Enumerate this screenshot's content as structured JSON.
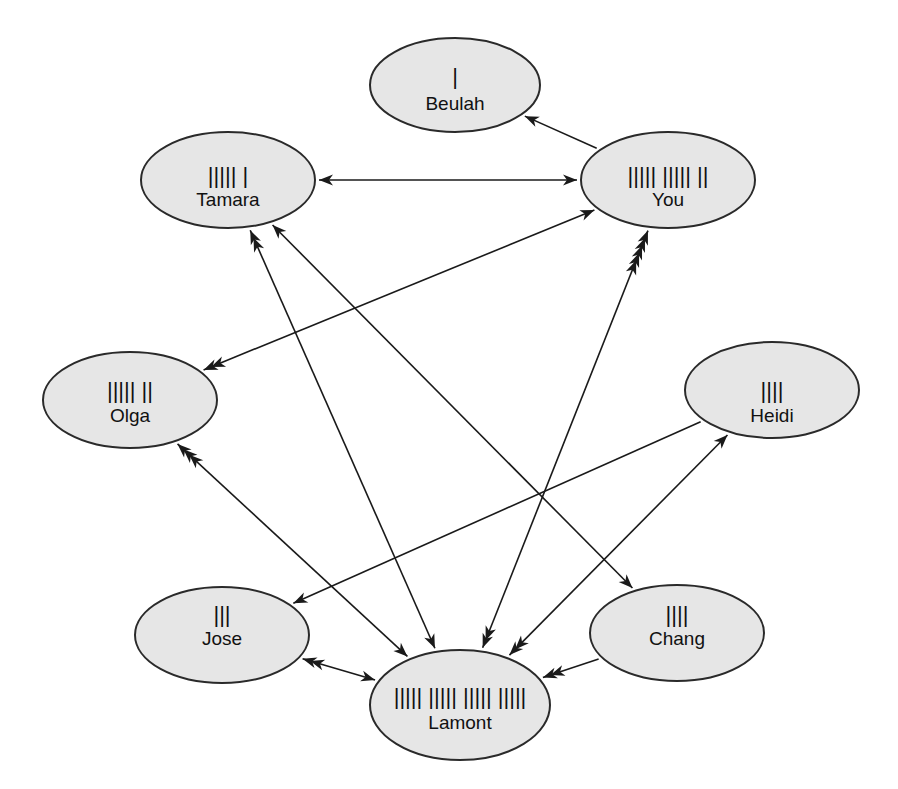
{
  "diagram": {
    "type": "network-sociogram",
    "nodes": [
      {
        "id": "beulah",
        "name": "Beulah",
        "tally": "|",
        "count": 1,
        "cx": 455,
        "cy": 85,
        "rx": 85,
        "ry": 47
      },
      {
        "id": "tamara",
        "name": "Tamara",
        "tally": "||||| |",
        "count": 6,
        "cx": 228,
        "cy": 180,
        "rx": 87,
        "ry": 48
      },
      {
        "id": "you",
        "name": "You",
        "tally": "||||| ||||| ||",
        "count": 12,
        "cx": 668,
        "cy": 180,
        "rx": 87,
        "ry": 48
      },
      {
        "id": "olga",
        "name": "Olga",
        "tally": "||||| ||",
        "count": 7,
        "cx": 130,
        "cy": 400,
        "rx": 87,
        "ry": 48
      },
      {
        "id": "heidi",
        "name": "Heidi",
        "tally": "||||",
        "count": 4,
        "cx": 772,
        "cy": 390,
        "rx": 87,
        "ry": 48
      },
      {
        "id": "jose",
        "name": "Jose",
        "tally": "|||",
        "count": 3,
        "cx": 222,
        "cy": 635,
        "rx": 87,
        "ry": 48
      },
      {
        "id": "chang",
        "name": "Chang",
        "tally": "||||",
        "count": 4,
        "cx": 677,
        "cy": 633,
        "rx": 87,
        "ry": 48
      },
      {
        "id": "lamont",
        "name": "Lamont",
        "tally": "||||| ||||| ||||| |||||",
        "count": 20,
        "cx": 460,
        "cy": 705,
        "rx": 90,
        "ry": 55
      }
    ],
    "edges": [
      {
        "from": "you",
        "to": "beulah",
        "heads": "end",
        "multi_end": 1
      },
      {
        "from": "tamara",
        "to": "you",
        "heads": "both",
        "multi_start": 1,
        "multi_end": 1
      },
      {
        "from": "you",
        "to": "olga",
        "heads": "both",
        "multi_start": 1,
        "multi_end": 2
      },
      {
        "from": "lamont",
        "to": "you",
        "heads": "both",
        "multi_start": 2,
        "multi_end": 5
      },
      {
        "from": "lamont",
        "to": "tamara",
        "heads": "both",
        "multi_start": 1,
        "multi_end": 2
      },
      {
        "from": "chang",
        "to": "tamara",
        "heads": "both",
        "multi_start": 1,
        "multi_end": 1
      },
      {
        "from": "lamont",
        "to": "olga",
        "heads": "both",
        "multi_start": 1,
        "multi_end": 3
      },
      {
        "from": "heidi",
        "to": "jose",
        "heads": "end",
        "multi_end": 1
      },
      {
        "from": "lamont",
        "to": "heidi",
        "heads": "both",
        "multi_start": 2,
        "multi_end": 1
      },
      {
        "from": "jose",
        "to": "lamont",
        "heads": "both",
        "multi_start": 2,
        "multi_end": 1
      },
      {
        "from": "chang",
        "to": "lamont",
        "heads": "end",
        "multi_end": 2
      }
    ]
  },
  "labels": {
    "beulah": {
      "tally": "|",
      "name": "Beulah"
    },
    "tamara": {
      "tally": "||||| |",
      "name": "Tamara"
    },
    "you": {
      "tally": "||||| ||||| ||",
      "name": "You"
    },
    "olga": {
      "tally": "||||| ||",
      "name": "Olga"
    },
    "heidi": {
      "tally": "||||",
      "name": "Heidi"
    },
    "jose": {
      "tally": "|||",
      "name": "Jose"
    },
    "chang": {
      "tally": "||||",
      "name": "Chang"
    },
    "lamont": {
      "tally": "||||| ||||| ||||| |||||",
      "name": "Lamont"
    }
  },
  "colors": {
    "node_fill": "#e6e6e6",
    "node_stroke": "#2a2a2a",
    "edge": "#1a1a1a",
    "text": "#111111",
    "background": "#ffffff"
  }
}
